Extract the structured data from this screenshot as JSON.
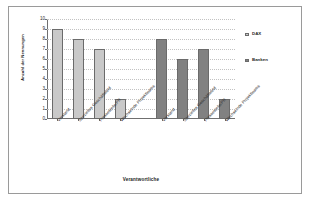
{
  "chart_data": {
    "type": "bar",
    "title": "",
    "xlabel": "Verantwortliche",
    "ylabel": "Anzahl der Nennungen",
    "ylim": [
      0,
      10
    ],
    "yticks": [
      0,
      1,
      2,
      3,
      4,
      5,
      6,
      7,
      8,
      9,
      10
    ],
    "grid": true,
    "legend_position": "right",
    "categories": [
      "Vorstand",
      "Spezielles Geschäftsfeld",
      "Pressestelle/PR",
      "Wechselnde Projektteams"
    ],
    "series": [
      {
        "name": "DAX",
        "color": "#c9c9c9",
        "values": [
          9,
          8,
          7,
          2
        ]
      },
      {
        "name": "Banken",
        "color": "#818181",
        "values": [
          8,
          6,
          7,
          2
        ]
      }
    ]
  },
  "legend": {
    "items": [
      {
        "label": "DAX",
        "marker": "square-marker-light"
      },
      {
        "label": "Banken",
        "marker": "square-marker-dark"
      }
    ]
  }
}
